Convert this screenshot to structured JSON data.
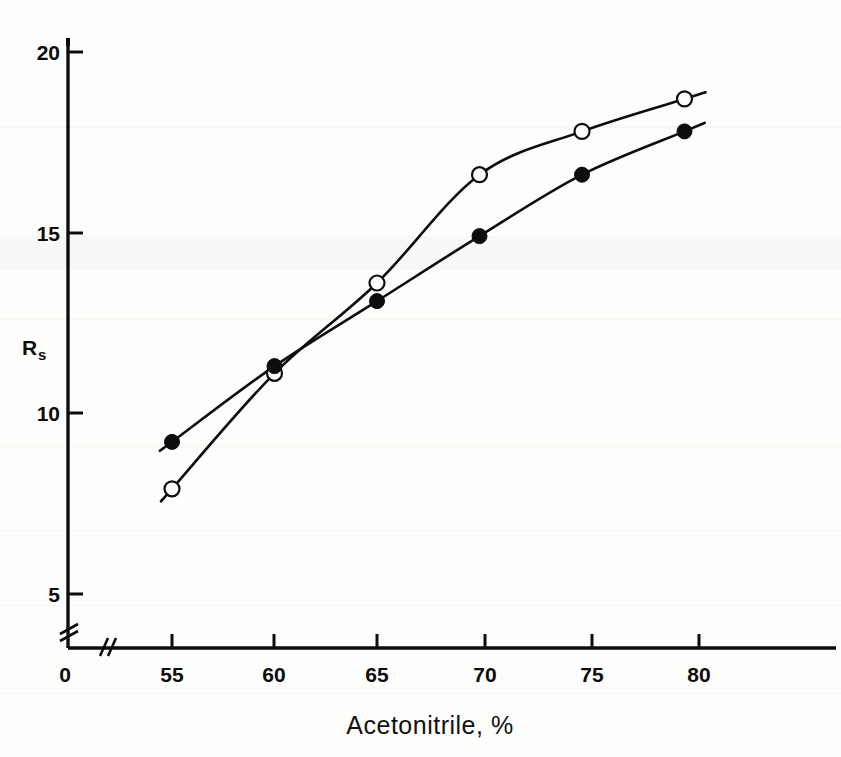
{
  "figure": {
    "background_color": "#fdfdfb",
    "ink_color": "#0d0d0d"
  },
  "axes": {
    "y_title": "R",
    "y_title_sub": "s",
    "y_ticks": [
      "20",
      "15",
      "10",
      "5"
    ],
    "y_origin_label": "0",
    "x_origin_label": "0",
    "x_ticks": [
      "55",
      "60",
      "65",
      "70",
      "75",
      "80"
    ],
    "x_caption": "Acetonitrile, %",
    "y_break_marker": "axis-break",
    "x_break_marker": "axis-break"
  },
  "chart_data": {
    "type": "line",
    "title": "",
    "xlabel": "Acetonitrile, %",
    "ylabel": "Rs",
    "xlim": [
      52.5,
      84
    ],
    "ylim": [
      0,
      21
    ],
    "x_tick_values": [
      55,
      60,
      65,
      70,
      75,
      80
    ],
    "y_tick_values": [
      5,
      10,
      15,
      20
    ],
    "x_axis_broken_between": [
      0,
      53
    ],
    "y_axis_broken_between": [
      0,
      4
    ],
    "grid": false,
    "legend": "none",
    "x": [
      55,
      60,
      65,
      70,
      75,
      80
    ],
    "series": [
      {
        "name": "filled-circle-series",
        "marker": "filled-circle",
        "values": [
          9.2,
          11.3,
          13.1,
          14.9,
          16.6,
          17.8
        ]
      },
      {
        "name": "open-circle-series",
        "marker": "open-circle",
        "values": [
          7.9,
          11.1,
          13.6,
          16.6,
          17.8,
          18.7
        ]
      }
    ]
  }
}
